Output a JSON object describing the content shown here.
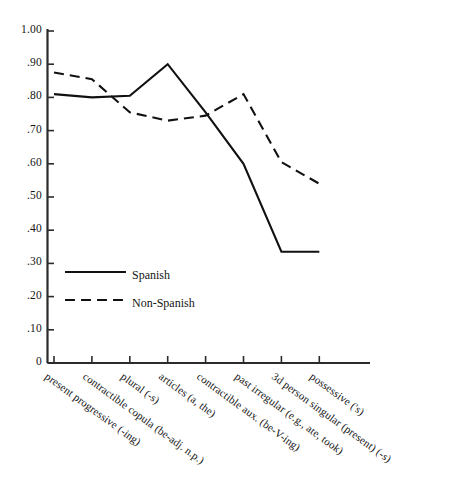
{
  "chart_data": {
    "type": "line",
    "title": "",
    "subtitle": "",
    "xlabel": "",
    "ylabel": "",
    "ylim": [
      0,
      1.0
    ],
    "grid": false,
    "legend_position": "inside-lower-left",
    "categories": [
      "present progressive (-ing)",
      "contractible copula (be-adj. n.p.)",
      "plural (-s)",
      "articles (a, the)",
      "contractible aux. (be-V-ing)",
      "past irregular (e.g., ate, took)",
      "3d person singular (present) (-s)",
      "possessive ('s)"
    ],
    "ytick_labels": [
      "1.00",
      ".90",
      ".80",
      ".70",
      ".60",
      ".50",
      ".40",
      ".30",
      ".20",
      ".10",
      "0"
    ],
    "ytick_values": [
      1.0,
      0.9,
      0.8,
      0.7,
      0.6,
      0.5,
      0.4,
      0.3,
      0.2,
      0.1,
      0.0
    ],
    "series": [
      {
        "name": "Spanish",
        "style": "solid",
        "color": "#111111",
        "values": [
          0.81,
          0.8,
          0.805,
          0.9,
          0.755,
          0.6,
          0.335,
          0.335
        ]
      },
      {
        "name": "Non-Spanish",
        "style": "dashed",
        "color": "#111111",
        "values": [
          0.875,
          0.855,
          0.755,
          0.73,
          0.745,
          0.81,
          0.605,
          0.54
        ]
      }
    ]
  },
  "legend": {
    "entries": [
      {
        "label": "Spanish",
        "style": "solid"
      },
      {
        "label": "Non-Spanish",
        "style": "dashed"
      }
    ]
  },
  "axes": {
    "axis_color": "#2b2b2b"
  }
}
